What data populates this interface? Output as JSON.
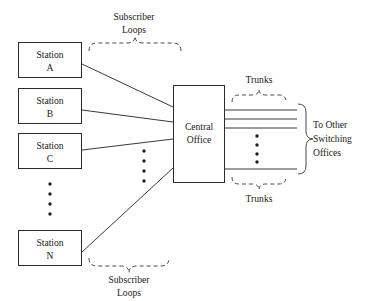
{
  "diagram": {
    "stations": [
      {
        "id": "station-a",
        "line1": "Station",
        "line2": "A"
      },
      {
        "id": "station-b",
        "line1": "Station",
        "line2": "B"
      },
      {
        "id": "station-c",
        "line1": "Station",
        "line2": "C"
      },
      {
        "id": "station-n",
        "line1": "Station",
        "line2": "N"
      }
    ],
    "central_office": {
      "line1": "Central",
      "line2": "Office"
    },
    "annotations": {
      "subscriber_loops_top_line1": "Subscriber",
      "subscriber_loops_top_line2": "Loops",
      "subscriber_loops_bottom_line1": "Subscriber",
      "subscriber_loops_bottom_line2": "Loops",
      "trunks_top": "Trunks",
      "trunks_bottom": "Trunks",
      "to_other_line1": "To Other",
      "to_other_line2": "Switching",
      "to_other_line3": "Offices"
    },
    "ellipsis": {
      "stations_gap_dots": 4,
      "loops_gap_dots": 4,
      "trunks_gap_dots": 4
    },
    "colors": {
      "stroke": "#2b2b2b",
      "line": "#3a3a3a",
      "brace": "#4a4a4a",
      "text": "#1a1a1a",
      "background": "#ffffff"
    }
  }
}
